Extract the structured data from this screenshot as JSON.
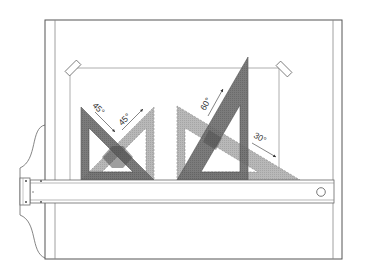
{
  "figure": {
    "colors": {
      "board_line": "#555555",
      "paper_line": "#9a9a9a",
      "dark_triangle": "#6f6f6f",
      "light_triangle": "#b3b3b3",
      "overlap": "#555555",
      "background": "#ffffff"
    },
    "labels": {
      "angle_45_left": "45°",
      "angle_45_right": "45°",
      "angle_60": "60°",
      "angle_30": "30°"
    },
    "components": [
      {
        "name": "drawing-board",
        "description": "Board outline with inner border"
      },
      {
        "name": "paper-sheet",
        "description": "Sheet of paper held by two clips"
      },
      {
        "name": "clip-left",
        "description": "Top-left paper clip"
      },
      {
        "name": "clip-right",
        "description": "Top-right paper clip"
      },
      {
        "name": "t-square",
        "description": "Horizontal T-square with head on the left and hanging hole on the right"
      },
      {
        "name": "set-square-45",
        "description": "Pair of 45° set squares (dark and light)"
      },
      {
        "name": "set-square-30-60",
        "description": "Pair of 30°/60° set squares (dark 60° and light 30°)"
      }
    ]
  }
}
